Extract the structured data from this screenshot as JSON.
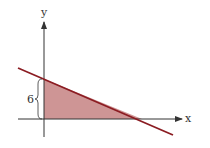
{
  "diagram": {
    "type": "graph",
    "axes": {
      "x_label": "x",
      "y_label": "y"
    },
    "annotations": {
      "height_label": "6"
    },
    "colors": {
      "line": "#8b1c22",
      "fill": "#c98a8a",
      "axis": "#333333"
    }
  }
}
